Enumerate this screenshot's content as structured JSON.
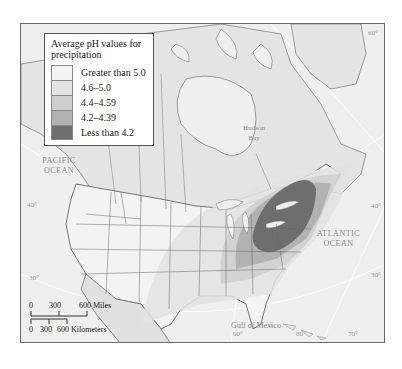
{
  "legend": {
    "title": "Average pH values for precipitation",
    "items": [
      {
        "label": "Greater than 5.0",
        "color": "#f3f3f3"
      },
      {
        "label": "4.6–5.0",
        "color": "#e2e2e2"
      },
      {
        "label": "4.4–4.59",
        "color": "#cfcfcf"
      },
      {
        "label": "4.2–4.39",
        "color": "#b2b2b2"
      },
      {
        "label": "Less than 4.2",
        "color": "#6e6e6e"
      }
    ]
  },
  "labels": {
    "pacific": "PACIFIC OCEAN",
    "atlantic": "ATLANTIC OCEAN",
    "hudson": "Hudson Bay",
    "gulf": "Gulf of Mexico"
  },
  "graticule": {
    "left_40": "40°",
    "left_30": "30°",
    "right_40": "40°",
    "right_30": "30°",
    "right_60": "60°",
    "bottom_90": "90°",
    "bottom_80": "80°",
    "bottom_70": "70°"
  },
  "scale": {
    "miles": {
      "ticks": [
        "0",
        "300",
        "600"
      ],
      "unit": "Miles"
    },
    "km": {
      "ticks": [
        "0",
        "300",
        "600"
      ],
      "unit": "Kilometers"
    }
  }
}
